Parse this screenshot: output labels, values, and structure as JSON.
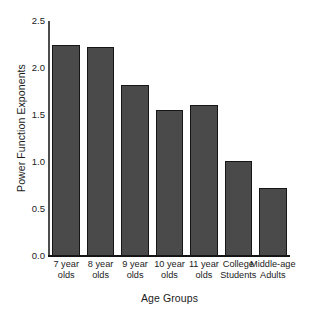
{
  "chart_data": {
    "type": "bar",
    "title": "",
    "xlabel": "Age Groups",
    "ylabel": "Power Function Exponents",
    "categories": [
      "7 year olds",
      "8 year olds",
      "9 year olds",
      "10 year olds",
      "11 year olds",
      "College Students",
      "Middle-age Adults"
    ],
    "category_lines": [
      [
        "7 year",
        "olds"
      ],
      [
        "8 year",
        "olds"
      ],
      [
        "9 year",
        "olds"
      ],
      [
        "10 year",
        "olds"
      ],
      [
        "11 year",
        "olds"
      ],
      [
        "College",
        "Students"
      ],
      [
        "Middle-age",
        "Adults"
      ]
    ],
    "values": [
      2.24,
      2.22,
      1.82,
      1.55,
      1.61,
      1.01,
      0.72
    ],
    "ylim": [
      0.0,
      2.5
    ],
    "yticks": [
      0.0,
      0.5,
      1.0,
      1.5,
      2.0,
      2.5
    ],
    "ytick_labels": [
      "0.0",
      "0.5",
      "1.0",
      "1.5",
      "2.0",
      "2.5"
    ],
    "grid": false,
    "legend": null,
    "bar_color": "#4a4a4a",
    "bar_edge_color": "#161616",
    "background_color": "#ffffff",
    "axis_color": "#141414",
    "text_color": "#1b1b1b"
  }
}
